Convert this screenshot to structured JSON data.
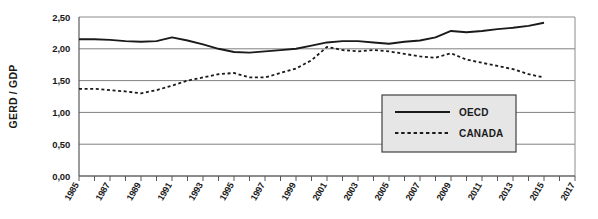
{
  "chart_data": {
    "type": "line",
    "title": "",
    "xlabel": "",
    "ylabel": "GERD / GDP",
    "ylim": [
      0,
      2.5
    ],
    "xlim": [
      1985,
      2017
    ],
    "y_ticks": [
      0,
      0.5,
      1.0,
      1.5,
      2.0,
      2.5
    ],
    "y_tick_labels": [
      "0,00",
      "0,50",
      "1,00",
      "1,50",
      "2,00",
      "2,50"
    ],
    "x_ticks": [
      1985,
      1986,
      1987,
      1988,
      1989,
      1990,
      1991,
      1992,
      1993,
      1994,
      1995,
      1996,
      1997,
      1998,
      1999,
      2000,
      2001,
      2002,
      2003,
      2004,
      2005,
      2006,
      2007,
      2008,
      2009,
      2010,
      2011,
      2012,
      2013,
      2014,
      2015,
      2016,
      2017
    ],
    "x_tick_labels": [
      "1985",
      "",
      "1987",
      "",
      "1989",
      "",
      "1991",
      "",
      "1993",
      "",
      "1995",
      "",
      "1997",
      "",
      "1999",
      "",
      "2001",
      "",
      "2003",
      "",
      "2005",
      "",
      "2007",
      "",
      "2009",
      "",
      "2011",
      "",
      "2013",
      "",
      "2015",
      "",
      "2017"
    ],
    "grid": true,
    "grid_axis": "y",
    "legend_position": "inside-lower-right",
    "x": [
      1985,
      1986,
      1987,
      1988,
      1989,
      1990,
      1991,
      1992,
      1993,
      1994,
      1995,
      1996,
      1997,
      1998,
      1999,
      2000,
      2001,
      2002,
      2003,
      2004,
      2005,
      2006,
      2007,
      2008,
      2009,
      2010,
      2011,
      2012,
      2013,
      2014,
      2015
    ],
    "series": [
      {
        "name": "OECD",
        "style": "solid",
        "color": "#1a1a1a",
        "values": [
          2.15,
          2.15,
          2.14,
          2.12,
          2.11,
          2.12,
          2.18,
          2.13,
          2.07,
          2.0,
          1.95,
          1.94,
          1.96,
          1.98,
          2.0,
          2.05,
          2.1,
          2.12,
          2.12,
          2.1,
          2.08,
          2.11,
          2.13,
          2.18,
          2.28,
          2.26,
          2.28,
          2.31,
          2.33,
          2.36,
          2.41
        ]
      },
      {
        "name": "CANADA",
        "style": "dashed",
        "color": "#1a1a1a",
        "values": [
          1.37,
          1.37,
          1.35,
          1.33,
          1.3,
          1.35,
          1.42,
          1.5,
          1.55,
          1.6,
          1.62,
          1.55,
          1.55,
          1.62,
          1.69,
          1.82,
          2.03,
          1.98,
          1.96,
          1.98,
          1.96,
          1.92,
          1.88,
          1.86,
          1.93,
          1.83,
          1.78,
          1.73,
          1.68,
          1.6,
          1.55
        ]
      }
    ]
  },
  "axis": {
    "y_title": "GERD / GDP"
  },
  "legend": {
    "entries": [
      {
        "label": "OECD",
        "style": "solid"
      },
      {
        "label": "CANADA",
        "style": "dashed"
      }
    ]
  },
  "colors": {
    "line": "#1a1a1a",
    "grid": "#808080",
    "axis": "#595959",
    "legend_fill": "#e6e6e6",
    "legend_border": "#404040",
    "plot_border": "#8c8c8c",
    "text": "#1a1a1a"
  }
}
